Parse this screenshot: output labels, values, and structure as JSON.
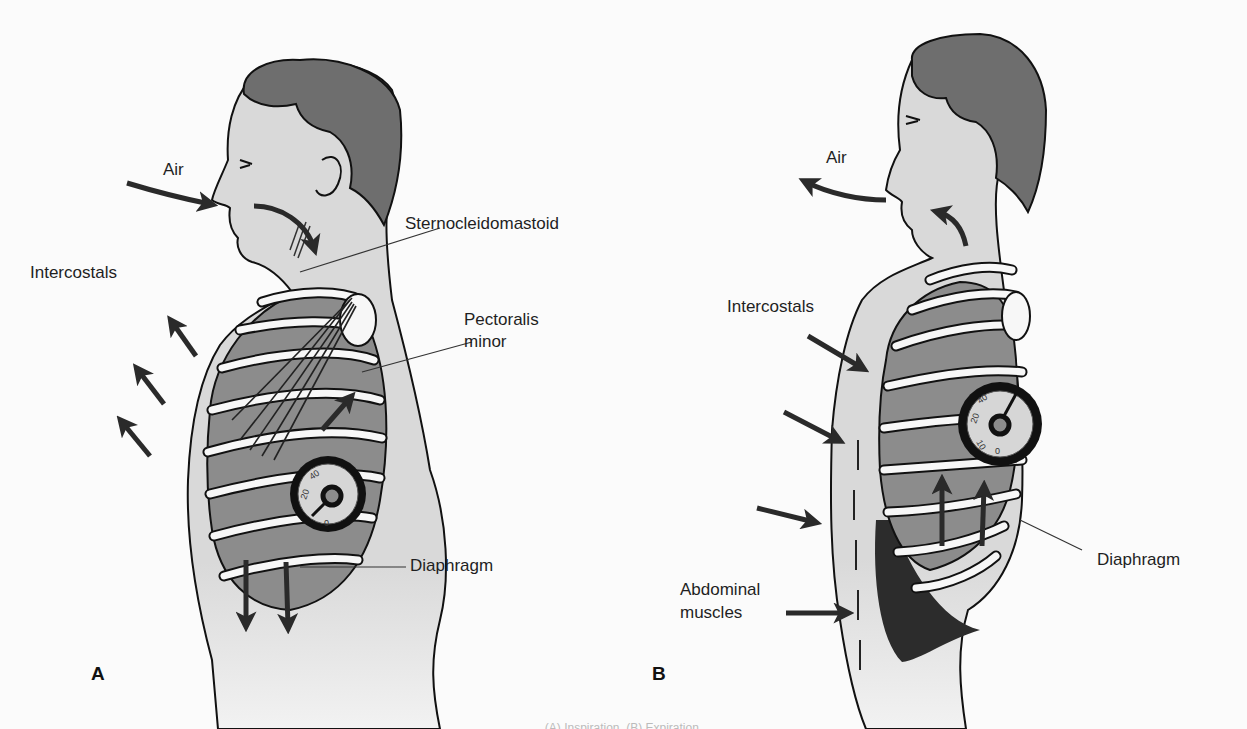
{
  "figure": {
    "caption_partial": "(A) Inspiration. (B) Expiration.",
    "colors": {
      "background": "#fbfbfb",
      "skin": "#d9d9d9",
      "hair": "#6e6e6e",
      "lung": "#8c8c8c",
      "rib": "#f7f7f7",
      "outline": "#111111",
      "arrow": "#2a2a2a"
    }
  },
  "panel_a": {
    "panel_label": "A",
    "state": "inspiration",
    "labels": {
      "air": "Air",
      "intercostals": "Intercostals",
      "sternocleidomastoid": "Sternocleidomastoid",
      "pectoralis_minor_1": "Pectoralis",
      "pectoralis_minor_2": "minor",
      "diaphragm": "Diaphragm"
    },
    "gauge": {
      "ticks": [
        "0",
        "20",
        "40"
      ],
      "needle": "low"
    },
    "arrows": {
      "air": "inward",
      "intercostals": "outward",
      "diaphragm": "down"
    }
  },
  "panel_b": {
    "panel_label": "B",
    "state": "expiration",
    "labels": {
      "air": "Air",
      "intercostals": "Intercostals",
      "abdominal_muscles_1": "Abdominal",
      "abdominal_muscles_2": "muscles",
      "diaphragm": "Diaphragm"
    },
    "gauge": {
      "ticks": [
        "0",
        "10",
        "20",
        "40"
      ],
      "needle": "high"
    },
    "arrows": {
      "air": "outward",
      "intercostals": "inward",
      "diaphragm": "up"
    }
  }
}
